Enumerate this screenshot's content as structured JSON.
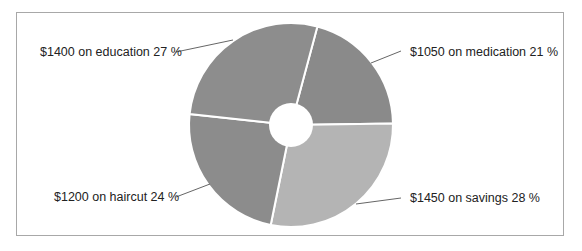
{
  "chart_data": {
    "type": "pie",
    "variant": "donut",
    "title": "",
    "categories": [
      "medication",
      "savings",
      "haircut",
      "education"
    ],
    "values": [
      1050,
      1450,
      1200,
      1400
    ],
    "percentages": [
      21,
      28,
      24,
      27
    ],
    "labels": [
      "$1050 on medication 21 %",
      "$1450 on savings 28 %",
      "$1200 on haircut 24 %",
      "$1400 on education 27 %"
    ],
    "colors": [
      "#8a8a8a",
      "#b4b4b4",
      "#8c8c8c",
      "#8d8d8d"
    ],
    "start_angle_deg": 15,
    "legend": "none",
    "label_position": "outside-with-leader-lines"
  },
  "labels": {
    "medication": "$1050 on medication 21 %",
    "savings": "$1450 on savings 28 %",
    "haircut": "$1200 on haircut 24 %",
    "education": "$1400 on education 27 %"
  }
}
